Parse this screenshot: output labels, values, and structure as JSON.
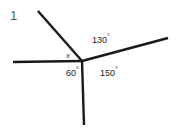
{
  "figure": {
    "question_number": "1",
    "vertex": {
      "x": 82,
      "y": 61
    },
    "stroke_color": "#1a1a1a",
    "background_color": "#ffffff",
    "rays": [
      {
        "name": "upper-left-ray",
        "x": 38,
        "y": 11
      },
      {
        "name": "left-horizontal-ray",
        "x": 13,
        "y": 62
      },
      {
        "name": "bottom-ray",
        "x": 84,
        "y": 125
      },
      {
        "name": "right-ray",
        "x": 168,
        "y": 38
      }
    ],
    "labels": {
      "unknown_angle": {
        "value": "x",
        "degree_symbol": "°"
      },
      "angle_130": {
        "value": "130",
        "degree_symbol": "°"
      },
      "angle_60": {
        "value": "60",
        "degree_symbol": "°"
      },
      "angle_150": {
        "value": "150",
        "degree_symbol": "°"
      }
    }
  }
}
